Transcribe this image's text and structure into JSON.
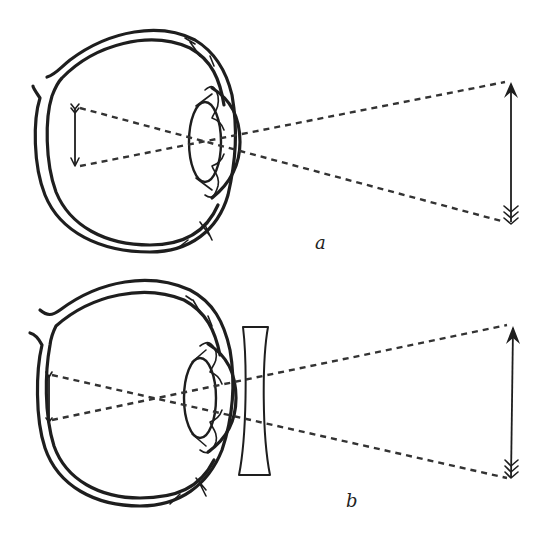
{
  "figure": {
    "colors": {
      "ink": "#1e1e1e",
      "ray": "#333333",
      "background": "#ffffff"
    },
    "panels": [
      {
        "id": "a",
        "label": "a",
        "components": [
          "eyeball",
          "lens",
          "cornea",
          "retinal-image-arrow",
          "object-arrow",
          "dashed-rays"
        ],
        "corrective_lens": false
      },
      {
        "id": "b",
        "label": "b",
        "components": [
          "eyeball",
          "lens",
          "cornea",
          "retinal-image-arrow",
          "object-arrow",
          "dashed-rays",
          "concave-lens"
        ],
        "corrective_lens": true
      }
    ]
  }
}
